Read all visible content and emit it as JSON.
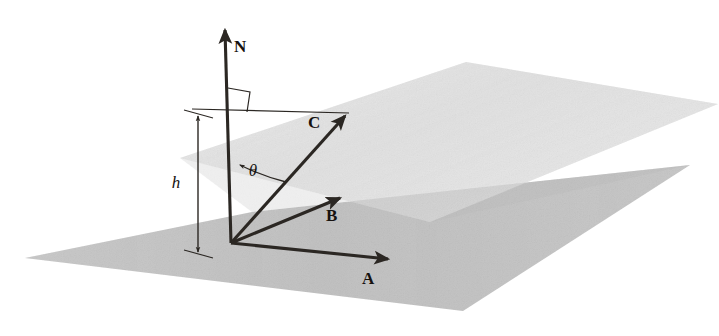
{
  "figure": {
    "background_color": "#ffffff",
    "ink_color": "#2b2723"
  },
  "labels": {
    "normal_vector": "N",
    "vector_a": "A",
    "vector_b": "B",
    "vector_c": "C",
    "angle": "θ",
    "height": "h"
  },
  "geometry": {
    "origin": {
      "x": 231,
      "y": 243
    },
    "vectors": [
      {
        "name": "N",
        "kind": "normal",
        "tail": {
          "x": 231,
          "y": 243
        },
        "tip": {
          "x": 225,
          "y": 26
        },
        "label_pos": {
          "x": 237,
          "y": 50
        },
        "arrowhead": true
      },
      {
        "name": "A",
        "kind": "in-plane",
        "tail": {
          "x": 231,
          "y": 243
        },
        "tip": {
          "x": 392,
          "y": 260
        },
        "label_pos": {
          "x": 369,
          "y": 282
        },
        "arrowhead": true
      },
      {
        "name": "B",
        "kind": "in-plane",
        "tail": {
          "x": 231,
          "y": 243
        },
        "tip": {
          "x": 343,
          "y": 196
        },
        "label_pos": {
          "x": 333,
          "y": 217
        },
        "arrowhead": true
      },
      {
        "name": "C",
        "kind": "oblique",
        "tail": {
          "x": 231,
          "y": 243
        },
        "tip": {
          "x": 348,
          "y": 113
        },
        "label_pos": {
          "x": 315,
          "y": 125
        },
        "arrowhead": true
      }
    ],
    "angle_arc": {
      "label": "θ",
      "from_vector": "N",
      "to_vector": "C",
      "label_pos": {
        "x": 253,
        "y": 176
      },
      "arrow_at": "N"
    },
    "right_angle_marker": {
      "at": {
        "x": 229,
        "y": 110
      },
      "size": 22,
      "between": [
        "N",
        "horizontal-line"
      ]
    },
    "height_dimension": {
      "label": "h",
      "label_pos": {
        "x": 182,
        "y": 182
      },
      "top": {
        "x": 198,
        "y": 114
      },
      "bottom": {
        "x": 198,
        "y": 253
      },
      "double_headed": true
    },
    "horizontal_guide": {
      "from": {
        "x": 192,
        "y": 109
      },
      "to": {
        "x": 349,
        "y": 113
      }
    }
  },
  "planes": [
    {
      "name": "base-plane",
      "fill": "#bdbdbd",
      "opacity": 0.92,
      "points": "25,258 252,212 690,165 463,311"
    },
    {
      "name": "upper-plane",
      "fill": "#d6d6d6",
      "opacity": 0.78,
      "points": "180,158 466,62 718,104 430,222"
    }
  ],
  "palette": {
    "base_plane_gray": "#bdbdbd",
    "upper_plane_gray": "#d6d6d6",
    "lightest_region": "#f2f2f2",
    "mid_region": "#c8c8c8",
    "dark_region": "#a8a8a8",
    "line_color": "#2b2723"
  }
}
